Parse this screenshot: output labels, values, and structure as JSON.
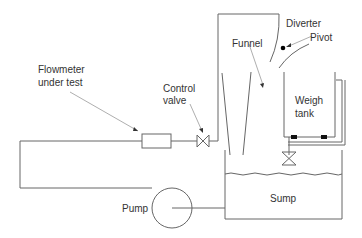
{
  "diagram": {
    "labels": {
      "flowmeter_line1": "Flowmeter",
      "flowmeter_line2": "under test",
      "control_valve_line1": "Control",
      "control_valve_line2": "valve",
      "funnel": "Funnel",
      "diverter": "Diverter",
      "pivot": "Pivot",
      "weigh_tank_line1": "Weigh",
      "weigh_tank_line2": "tank",
      "sump": "Sump",
      "pump": "Pump"
    },
    "colors": {
      "line": "#666666",
      "text": "#333333",
      "pointer": "#999999",
      "fill": "#000000"
    }
  }
}
